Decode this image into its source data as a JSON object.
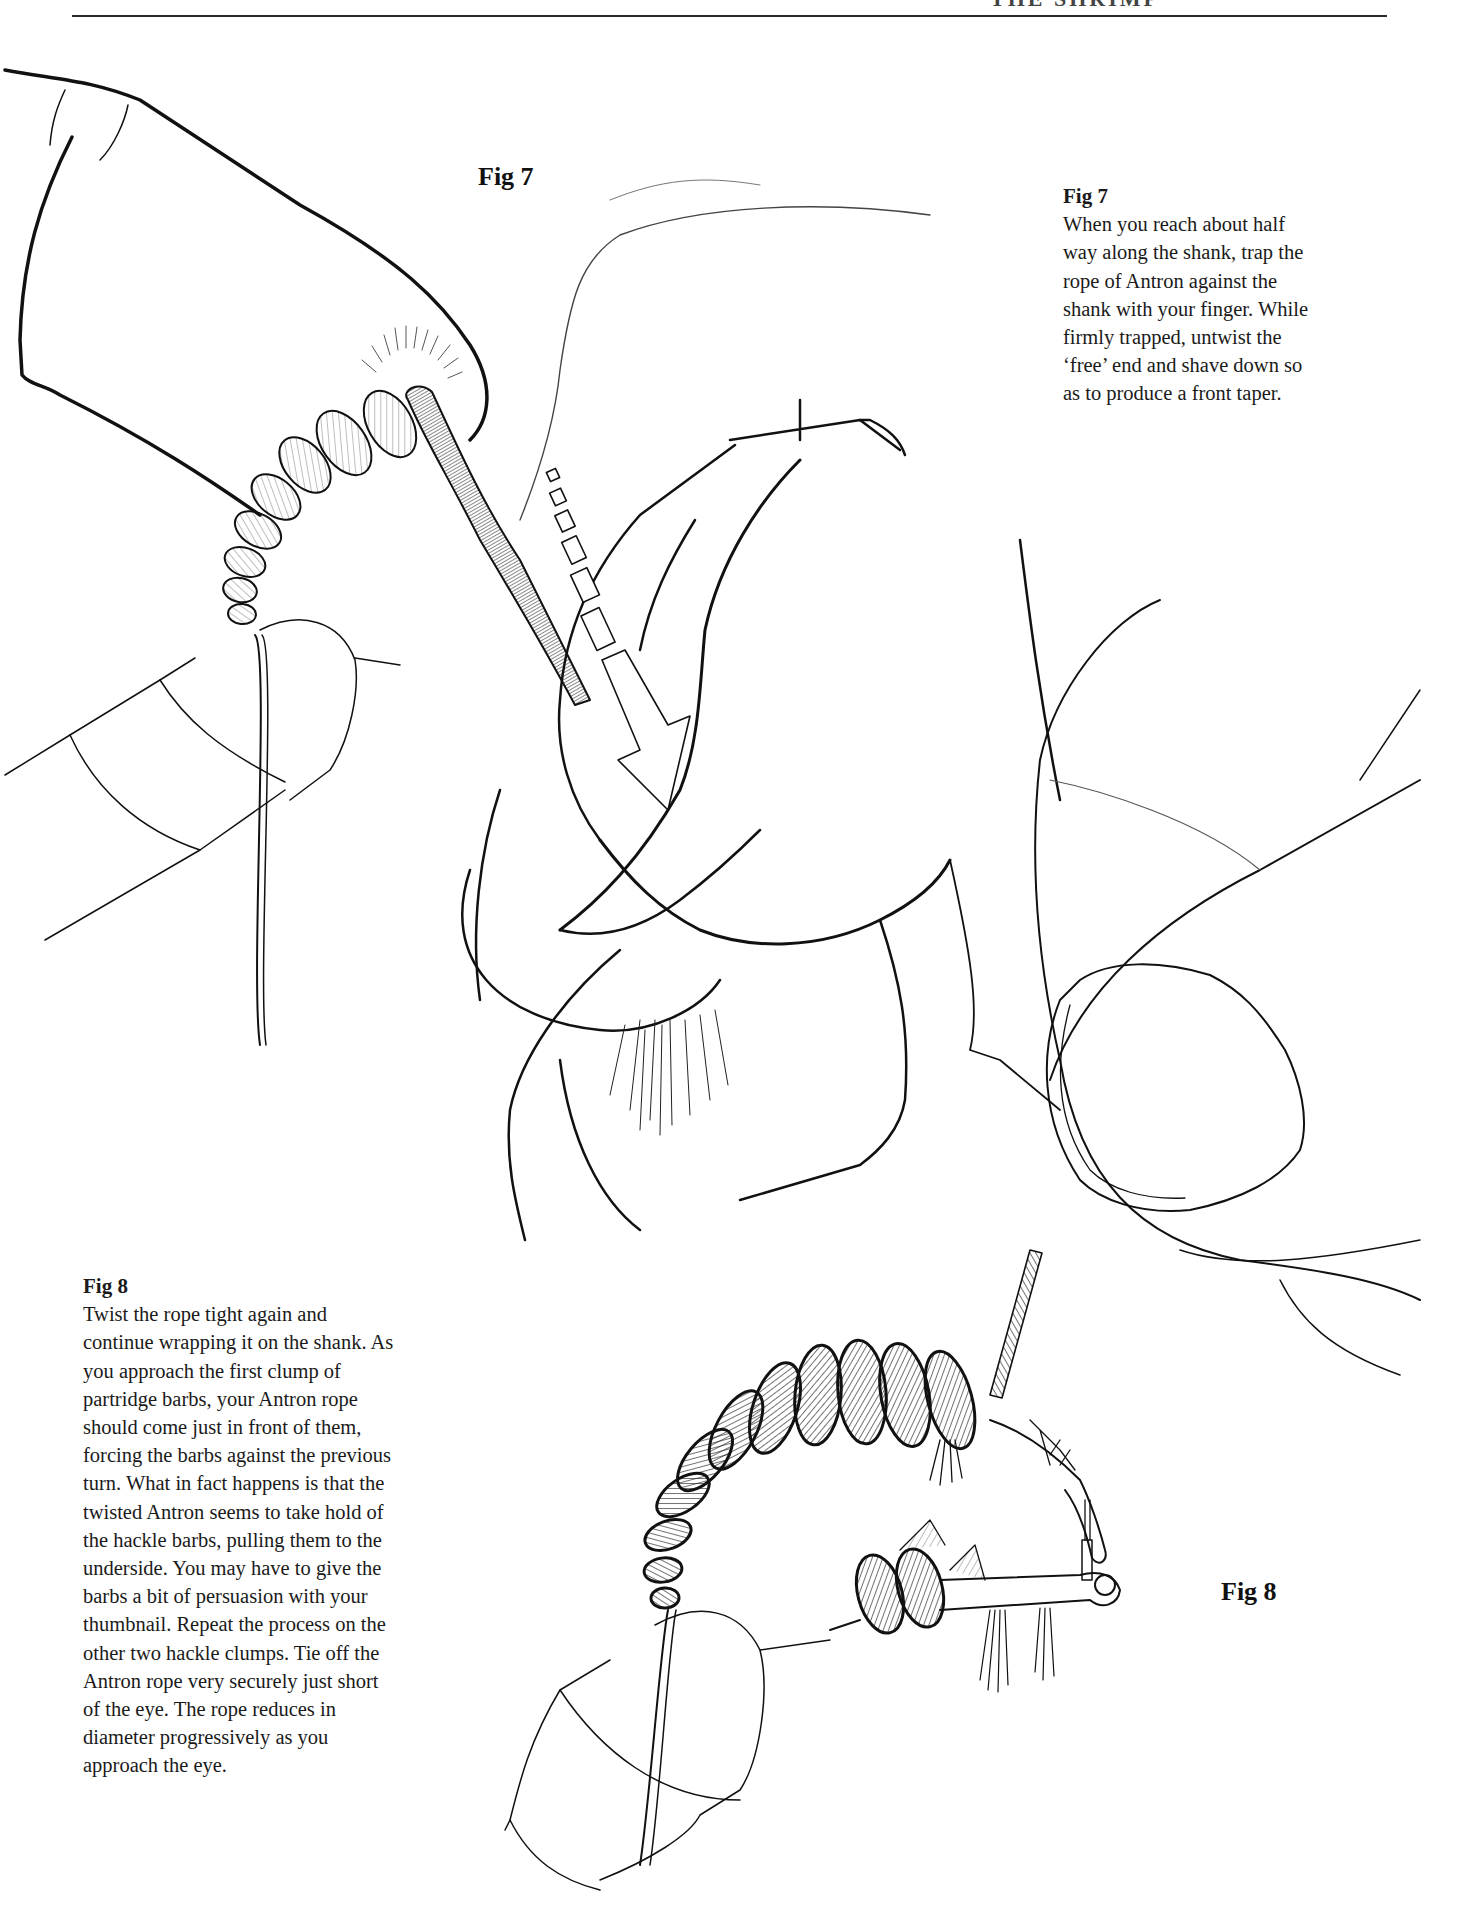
{
  "page": {
    "header_running_title": "THE SHRIMP"
  },
  "figures": [
    {
      "id": "fig7",
      "label": "Fig 7",
      "illustration": "hands-holding-hook-twisting-antron-rope",
      "caption": {
        "title": "Fig 7",
        "lines": [
          "When you reach about half",
          "way along the shank, trap the",
          "rope of Antron against the",
          "shank with your finger. While",
          "firmly trapped, untwist the",
          "‘free’ end and shave down so",
          "as to produce a front taper."
        ]
      }
    },
    {
      "id": "fig8",
      "label": "Fig 8",
      "illustration": "antron-rope-wrapped-on-hook-shank",
      "caption": {
        "title": "Fig 8",
        "lines": [
          "Twist the rope tight again and",
          "continue wrapping it on the shank. As",
          "you approach the first clump of",
          "partridge barbs, your Antron rope",
          "should come just in front of them,",
          "forcing the barbs against the previous",
          "turn. What in fact happens is that the",
          "twisted Antron seems to take hold of",
          "the hackle barbs, pulling them to the",
          "underside. You may have to give the",
          "barbs a bit of persuasion with your",
          "thumbnail. Repeat the process on the",
          "other two hackle clumps. Tie off the",
          "Antron rope very securely just short",
          "of the eye. The rope reduces in",
          "diameter progressively as you",
          "approach the eye."
        ]
      }
    }
  ],
  "colors": {
    "ink": "#1a1a1a",
    "paper": "#ffffff"
  }
}
